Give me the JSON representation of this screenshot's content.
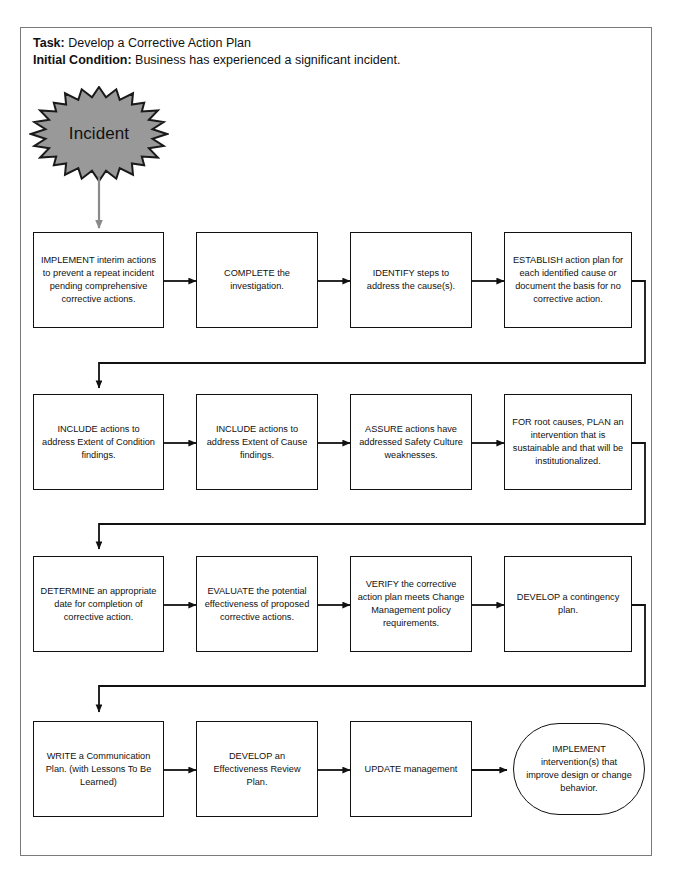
{
  "header": {
    "task_label": "Task:",
    "task_value": " Develop a Corrective Action Plan",
    "condition_label": "Initial Condition:",
    "condition_value": " Business has experienced a significant incident."
  },
  "start": {
    "shape": "starburst",
    "label": "Incident",
    "fill": "#999999",
    "stroke": "#1a1a1a"
  },
  "colors": {
    "frame": "#7a7a7a",
    "node_border": "#111111",
    "node_fill": "#ffffff",
    "text": "#111111",
    "start_arrow": "#808080",
    "connector": "#111111"
  },
  "rows": [
    {
      "nodes": [
        {
          "id": "implement-interim-actions",
          "text": "IMPLEMENT interim actions to prevent a repeat incident pending comprehensive corrective actions."
        },
        {
          "id": "complete-investigation",
          "text": "COMPLETE the investigation."
        },
        {
          "id": "identify-steps",
          "text": "IDENTIFY steps to address the cause(s)."
        },
        {
          "id": "establish-action-plan",
          "text": "ESTABLISH action plan for each identified cause or document the basis for no corrective action."
        }
      ]
    },
    {
      "nodes": [
        {
          "id": "include-extent-of-condition",
          "text": "INCLUDE actions to address Extent of Condition findings."
        },
        {
          "id": "include-extent-of-cause",
          "text": "INCLUDE actions to address Extent of Cause findings."
        },
        {
          "id": "assure-safety-culture",
          "text": "ASSURE actions have addressed Safety Culture weaknesses."
        },
        {
          "id": "plan-root-cause-intervention",
          "text": "FOR root causes, PLAN an intervention that is sustainable and that will be institutionalized."
        }
      ]
    },
    {
      "nodes": [
        {
          "id": "determine-completion-date",
          "text": "DETERMINE an appropriate date for completion of corrective action."
        },
        {
          "id": "evaluate-effectiveness",
          "text": "EVALUATE the potential effectiveness of proposed corrective actions."
        },
        {
          "id": "verify-change-management",
          "text": "VERIFY the corrective action plan meets Change Management policy requirements."
        },
        {
          "id": "develop-contingency-plan",
          "text": "DEVELOP a contingency plan."
        }
      ]
    },
    {
      "nodes": [
        {
          "id": "write-communication-plan",
          "text": "WRITE a Communication Plan. (with Lessons To Be Learned)"
        },
        {
          "id": "develop-effectiveness-review-plan",
          "text": "DEVELOP an Effectiveness Review Plan."
        },
        {
          "id": "update-management",
          "text": "UPDATE management"
        }
      ]
    }
  ],
  "end": {
    "id": "implement-interventions",
    "shape": "rounded",
    "text": "IMPLEMENT intervention(s) that improve design or change behavior."
  }
}
